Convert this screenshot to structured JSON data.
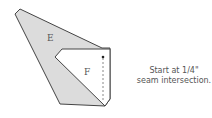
{
  "diagram": {
    "piece_labels": {
      "e": "E",
      "f": "F"
    },
    "caption": {
      "line1": "Start at 1/4\"",
      "line2": "seam intersection."
    },
    "colors": {
      "piece_e_fill": "#dcdcdc",
      "piece_f_fill": "#ffffff",
      "outline": "#444444",
      "seam": "#888888",
      "text": "#555555"
    }
  }
}
